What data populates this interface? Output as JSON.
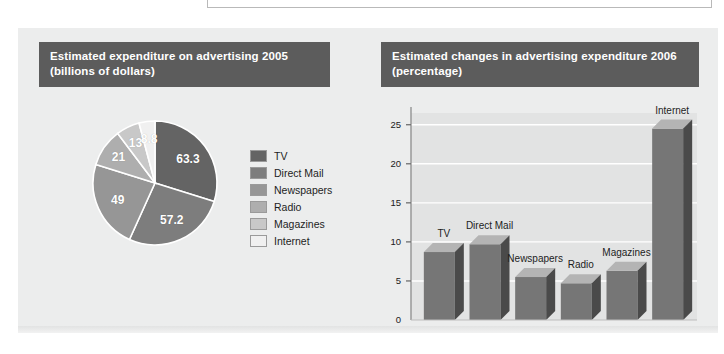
{
  "page": {
    "background_color": "#ffffff",
    "panel_color": "#eceded",
    "title_bar_color": "#5c5c5c",
    "title_text_color": "#ffffff"
  },
  "pie_chart": {
    "title_line1": "Estimated expenditure on advertising 2005",
    "title_line2": "(billions of dollars)",
    "legend": [
      {
        "label": "TV",
        "color": "#646464"
      },
      {
        "label": "Direct Mail",
        "color": "#7d7d7d"
      },
      {
        "label": "Newspapers",
        "color": "#969696"
      },
      {
        "label": "Radio",
        "color": "#aeaeae"
      },
      {
        "label": "Magazines",
        "color": "#c8c8c8"
      },
      {
        "label": "Internet",
        "color": "#f0f0f0"
      }
    ]
  },
  "bar_chart": {
    "title_line1": "Estimated changes in advertising expenditure 2006",
    "title_line2": "(percentage)"
  },
  "chart_data": [
    {
      "type": "pie",
      "title": "Estimated expenditure on advertising 2005 (billions of dollars)",
      "unit": "billions of dollars",
      "legend_position": "right",
      "categories": [
        "TV",
        "Direct Mail",
        "Newspapers",
        "Radio",
        "Magazines",
        "Internet"
      ],
      "values": [
        63.3,
        57.2,
        49,
        21,
        13,
        8.8
      ],
      "value_labels": [
        "63.3",
        "57.2",
        "49",
        "21",
        "13",
        "8.8"
      ],
      "colors": [
        "#646464",
        "#7d7d7d",
        "#969696",
        "#aeaeae",
        "#c8c8c8",
        "#f0f0f0"
      ],
      "total": 212.3
    },
    {
      "type": "bar",
      "title": "Estimated changes in advertising expenditure 2006 (percentage)",
      "xlabel": "",
      "ylabel": "",
      "unit": "percentage",
      "categories": [
        "TV",
        "Direct Mail",
        "Newspapers",
        "Radio",
        "Magazines",
        "Internet"
      ],
      "values": [
        8.7,
        9.7,
        5.5,
        4.7,
        6.3,
        24.5
      ],
      "ylim": [
        0,
        26.5
      ],
      "yticks": [
        0,
        5,
        10,
        15,
        20,
        25
      ],
      "ytick_labels": [
        "0",
        "5",
        "10",
        "15",
        "20",
        "25"
      ],
      "grid": true,
      "grid_color": "#ffffff",
      "plot_background": "#e2e3e3",
      "bar_face_color": "#767676",
      "bar_top_color": "#b4b4b4",
      "bar_side_color": "#4a4a4a",
      "legend_position": "none"
    }
  ]
}
